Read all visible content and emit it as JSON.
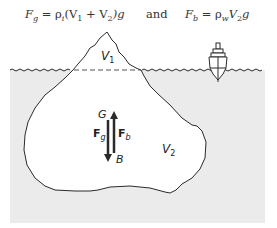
{
  "equations": {
    "gravity": {
      "lhs": "F",
      "lhs_sub": "g",
      "eq": " = ρ",
      "rho_sub": "i",
      "body": "(V",
      "v1_sub": "1",
      "plus": " + V",
      "v2_sub": "2",
      "tail": ")g"
    },
    "connector": "and",
    "buoyancy": {
      "lhs": "F",
      "lhs_sub": "b",
      "eq": " = ρ",
      "rho_sub": "w",
      "body": "V",
      "v_sub": "2",
      "tail": "g"
    }
  },
  "labels": {
    "v1": "V",
    "v1_sub": "1",
    "v2": "V",
    "v2_sub": "2",
    "g_point": "G",
    "b_point": "B",
    "fg": "F",
    "fg_sub": "g",
    "fb": "F",
    "fb_sub": "b"
  },
  "colors": {
    "water": "#ebebeb",
    "outline": "#2a2a2a",
    "iceberg": "#ffffff"
  }
}
